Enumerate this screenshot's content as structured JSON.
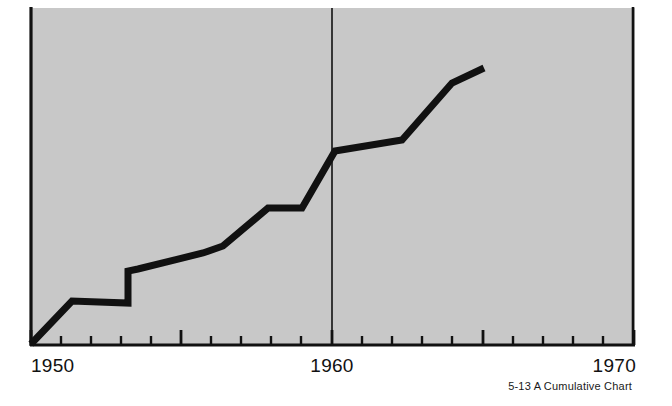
{
  "figure": {
    "caption_number": "5-13",
    "caption_title": "A Cumulative Chart",
    "caption_full": "5-13  A Cumulative Chart",
    "background_color": "#ffffff",
    "plot_fill_color": "#c8c8c8",
    "ink_color": "#111111"
  },
  "chart_data": {
    "type": "line",
    "title": "A Cumulative Chart",
    "xlabel": "",
    "ylabel": "",
    "xlim": [
      1950,
      1970
    ],
    "ylim": [
      0,
      100
    ],
    "grid": false,
    "legend": null,
    "axis": {
      "x_tick_labels": [
        "1950",
        "1960",
        "1970"
      ],
      "x_tick_label_values": [
        1950,
        1960,
        1970
      ],
      "x_minor_tick_values": [
        1951,
        1952,
        1953,
        1954,
        1956,
        1957,
        1958,
        1959,
        1961,
        1962,
        1963,
        1964,
        1966,
        1967,
        1968,
        1969
      ],
      "x_major_tick_values": [
        1950,
        1955,
        1960,
        1965,
        1970
      ],
      "y_axis_visible_line": true,
      "y_tick_labels": []
    },
    "reference_line": {
      "orientation": "vertical",
      "value": 1960,
      "label": "1960"
    },
    "series": [
      {
        "name": "Cumulative total",
        "x": [
          1950.0,
          1951.1,
          1953.5,
          1953.6,
          1955.3,
          1957.2,
          1957.9,
          1959.0,
          1959.1,
          1960.1,
          1962.3,
          1963.1,
          1964.7,
          1965.8
        ],
        "values": [
          0.0,
          12.8,
          18.0,
          27.5,
          31.0,
          40.5,
          40.8,
          40.8,
          46.0,
          57.8,
          60.8,
          61.5,
          78.0,
          82.5
        ]
      }
    ]
  },
  "geometry": {
    "plot_left": 30,
    "plot_right": 634,
    "plot_top": 8,
    "plot_bottom": 345,
    "divider_x": 332,
    "line_width": 7,
    "axis_width": 3,
    "polyline_points": "31,344 72,301 128,303 128,271 138,269 203,253 223,246 268,208 302,208 335,151 402,140 452,83 484,68",
    "minor_ticks_x": [
      61,
      91,
      121,
      151,
      211,
      241,
      271,
      301,
      362,
      392,
      422,
      452,
      513,
      543,
      573,
      603
    ],
    "major_ticks_x": [
      31,
      181,
      332,
      483,
      634
    ],
    "minor_tick_length": 9,
    "major_tick_length": 15
  },
  "labels": {
    "left": {
      "text": "1950",
      "x": 31,
      "y": 372
    },
    "middle": {
      "text": "1960",
      "x": 332,
      "y": 372
    },
    "right": {
      "text": "1970",
      "x": 634,
      "y": 372
    },
    "caption": {
      "x": 632,
      "y": 390
    }
  }
}
